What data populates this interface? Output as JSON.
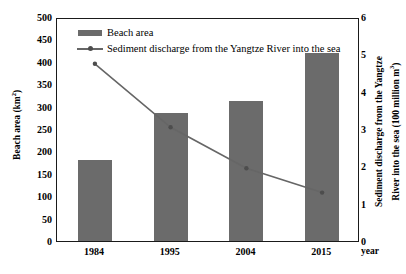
{
  "chart_data": {
    "type": "bar",
    "title": "",
    "categories": [
      "1984",
      "1995",
      "2004",
      "2015"
    ],
    "xlabel": "year",
    "series": [
      {
        "name": "Beach area",
        "type": "bar",
        "axis": "left",
        "unit": "km²",
        "values": [
          180,
          285,
          313,
          420
        ],
        "color": "#6b6b6b"
      },
      {
        "name": "Sediment discharge from the Yangtze River into the sea",
        "type": "line",
        "axis": "right",
        "unit": "100 million m³",
        "values": [
          4.8,
          3.1,
          2.0,
          1.35
        ],
        "color": "#666666"
      }
    ],
    "left_axis": {
      "label_main": "Beach area (km",
      "label_sup": "2",
      "label_tail": ")",
      "label_full": "Beach area (km²)",
      "min": 0,
      "max": 500,
      "step": 50,
      "ticks": [
        "500",
        "450",
        "400",
        "350",
        "300",
        "250",
        "200",
        "150",
        "100",
        "50",
        "0"
      ]
    },
    "right_axis": {
      "label_line1": "Sediment discharge from the Yangtze",
      "label_line2_main": "River into the sea (100 million m",
      "label_line2_sup": "3",
      "label_line2_tail": ")",
      "label_full": "Sediment discharge from the Yangtze River into the sea (100 million m³)",
      "min": 0,
      "max": 6,
      "step": 1,
      "ticks": [
        "6",
        "5",
        "4",
        "3",
        "2",
        "1",
        "0"
      ]
    },
    "grid": false,
    "legend_position": "top-left-inside",
    "legend": [
      {
        "label": "Beach area",
        "key": "swatch"
      },
      {
        "label": "Sediment discharge from the Yangtze River into the sea",
        "key": "line-marker"
      }
    ]
  }
}
